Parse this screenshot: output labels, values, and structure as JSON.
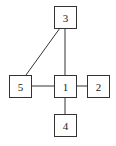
{
  "diagram": {
    "type": "graph",
    "nodes": [
      {
        "id": "1",
        "label": "1",
        "x": 54,
        "y": 75,
        "w": 22,
        "h": 22
      },
      {
        "id": "2",
        "label": "2",
        "x": 87,
        "y": 75,
        "w": 22,
        "h": 22
      },
      {
        "id": "3",
        "label": "3",
        "x": 54,
        "y": 6,
        "w": 22,
        "h": 22
      },
      {
        "id": "4",
        "label": "4",
        "x": 54,
        "y": 114,
        "w": 22,
        "h": 22
      },
      {
        "id": "5",
        "label": "5",
        "x": 9,
        "y": 75,
        "w": 22,
        "h": 22
      }
    ],
    "edges": [
      {
        "from": "1",
        "to": "2"
      },
      {
        "from": "1",
        "to": "3"
      },
      {
        "from": "1",
        "to": "4"
      },
      {
        "from": "1",
        "to": "5"
      },
      {
        "from": "3",
        "to": "5"
      }
    ],
    "colors": {
      "stroke": "#333333",
      "fill": "#ffffff",
      "text": "#222222"
    }
  }
}
